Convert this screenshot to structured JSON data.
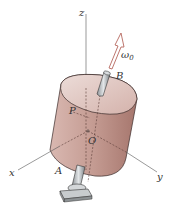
{
  "figure": {
    "type": "rigid-body-rotation-diagram",
    "labels": {
      "z_axis": "z",
      "x_axis": "x",
      "y_axis": "y",
      "origin": "O",
      "point_p": "P",
      "point_a": "A",
      "point_b": "B",
      "omega": "ω",
      "omega_sub": "0"
    },
    "colors": {
      "cylinder_fill": "#c9a39b",
      "cylinder_top": "#e6cfc9",
      "cylinder_dark": "#a8756c",
      "arrow": "#b5675e",
      "axis": "#555555",
      "shaft": "#b8bcbf"
    }
  }
}
